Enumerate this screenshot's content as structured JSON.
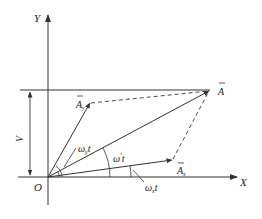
{
  "diagram": {
    "type": "vector-phasor",
    "colors": {
      "stroke": "#333333",
      "background": "#ffffff",
      "text": "#222222"
    },
    "axes": {
      "x_label": "X",
      "y_label": "Y",
      "origin_label": "O"
    },
    "vectors": {
      "resultant": {
        "label": "A",
        "bar": true
      },
      "y_component": {
        "label": "A",
        "subscript": "y",
        "bar": true
      },
      "x_component": {
        "label": "A",
        "subscript": "x",
        "bar": true
      }
    },
    "dimension": {
      "label": "V"
    },
    "angles": {
      "omega_y": {
        "symbol": "ω",
        "subscript": "y",
        "suffix": "t"
      },
      "omega_prime": {
        "symbol": "ω",
        "prime": "′",
        "suffix": "t"
      },
      "omega_x": {
        "symbol": "ω",
        "subscript": "x",
        "suffix": "t"
      }
    }
  }
}
